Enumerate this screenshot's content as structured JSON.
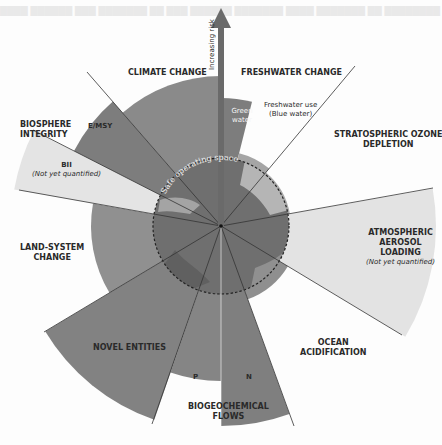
{
  "diagram": {
    "type": "planetary-boundaries-radial",
    "center_label": "Safe operating space",
    "arrow_label": "Increasing risk",
    "boundaries": [
      {
        "id": "climate-change",
        "label": "CLIMATE CHANGE",
        "sub": []
      },
      {
        "id": "freshwater-change",
        "label": "FRESHWATER CHANGE",
        "sub": [
          {
            "label": "Green water"
          },
          {
            "label": "Freshwater use (Blue water)",
            "line1": "Freshwater use",
            "line2": "(Blue water)"
          }
        ]
      },
      {
        "id": "stratospheric-ozone-depletion",
        "label": "STRATOSPHERIC OZONE DEPLETION",
        "line1": "STRATOSPHERIC OZONE",
        "line2": "DEPLETION"
      },
      {
        "id": "atmospheric-aerosol-loading",
        "label": "ATMOSPHERIC AEROSOL LOADING",
        "line1": "ATMOSPHERIC",
        "line2": "AEROSOL",
        "line3": "LOADING",
        "note": "(Not yet quantified)"
      },
      {
        "id": "ocean-acidification",
        "label": "OCEAN ACIDIFICATION",
        "line1": "OCEAN",
        "line2": "ACIDIFICATION"
      },
      {
        "id": "biogeochemical-flows",
        "label": "BIOGEOCHEMICAL FLOWS",
        "line1": "BIOGEOCHEMICAL",
        "line2": "FLOWS",
        "sub": [
          {
            "label": "P"
          },
          {
            "label": "N"
          }
        ]
      },
      {
        "id": "novel-entities",
        "label": "NOVEL ENTITIES"
      },
      {
        "id": "land-system-change",
        "label": "LAND-SYSTEM CHANGE",
        "line1": "LAND-SYSTEM",
        "line2": "CHANGE"
      },
      {
        "id": "biosphere-integrity",
        "label": "BIOSPHERE INTEGRITY",
        "line1": "BIOSPHERE",
        "line2": "INTEGRITY",
        "sub": [
          {
            "label": "E/MSY"
          },
          {
            "label": "BII",
            "note": "(Not yet quantified)"
          }
        ]
      }
    ],
    "colors": {
      "background": "#fdfdfd",
      "dark_wedge": "#7d7d7d",
      "mid_wedge": "#8f8f8f",
      "light_wedge": "#e2e2e2",
      "safe_circle": "#6e6e6e",
      "globe_light": "#a8a8a8",
      "divider": "#333333",
      "text": "#2a2a2a"
    }
  }
}
